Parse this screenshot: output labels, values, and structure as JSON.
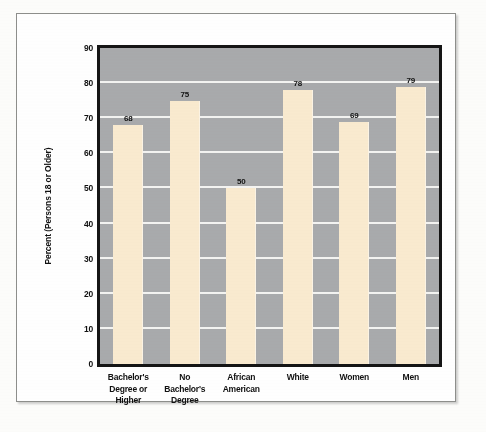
{
  "chart_data": {
    "type": "bar",
    "title": "",
    "xlabel": "",
    "ylabel": "Percent (Persons 18 or Older)",
    "categories": [
      "Bachelor's Degree or Higher",
      "No Bachelor's Degree",
      "African American",
      "White",
      "Women",
      "Men"
    ],
    "category_lines": [
      [
        "Bachelor's",
        "Degree or",
        "Higher"
      ],
      [
        "No",
        "Bachelor's",
        "Degree"
      ],
      [
        "African",
        "American"
      ],
      [
        "White"
      ],
      [
        "Women"
      ],
      [
        "Men"
      ]
    ],
    "values": [
      68,
      75,
      50,
      78,
      69,
      79
    ],
    "ylim": [
      0,
      90
    ],
    "yticks": [
      0,
      10,
      20,
      30,
      40,
      50,
      60,
      70,
      80,
      90
    ],
    "ytick_labels": [
      "0",
      "10",
      "20",
      "30",
      "40",
      "50",
      "60",
      "70",
      "80",
      "90"
    ],
    "grid": true,
    "grid_axis": "y",
    "legend": "none",
    "bar_color": "#faebd0",
    "plot_background": "#a9abad",
    "gridline_color": "#f4f4f2",
    "axis_color": "#151515",
    "value_label_color": "#111111"
  }
}
